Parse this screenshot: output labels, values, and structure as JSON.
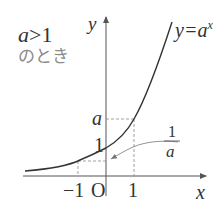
{
  "condition": {
    "inequality": "a>1",
    "inequality_var": "a",
    "inequality_rest": ">1",
    "note": "のとき"
  },
  "axes": {
    "x_label": "x",
    "y_label": "y",
    "origin_label": "O"
  },
  "curve": {
    "label_prefix": "y=",
    "label_base": "a",
    "label_exp": "x",
    "color": "#333333"
  },
  "ticks": {
    "x_neg_one": "−1",
    "x_one": "1",
    "y_one": "1",
    "y_a": "a"
  },
  "annotation": {
    "numerator": "1",
    "denominator": "a"
  },
  "colors": {
    "axis": "#555555",
    "dashed": "#888888",
    "text": "#333333",
    "muted": "#8a8a8a"
  }
}
